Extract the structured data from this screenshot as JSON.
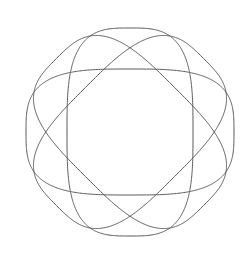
{
  "canvas": {
    "width": 250,
    "height": 269,
    "background_color": "#ffffff",
    "title": "four-petal-spirograph"
  },
  "figure": {
    "name": "four-lobe-rose-curve",
    "stroke_color": "#5a5a5a",
    "stroke_width": 1.0,
    "fill": "none",
    "center_x": 130,
    "center_y": 132,
    "lobe_count": 4,
    "lobe_semi_major": 104,
    "lobe_semi_minor": 63,
    "lobe_squareness": 0.62,
    "rotation_step_degrees": 45,
    "rotations": [
      0,
      45,
      90,
      135
    ],
    "bounds": {
      "left": 22,
      "top": 22,
      "right": 238,
      "bottom": 243
    },
    "intersections": [
      {
        "name": "center-upper-crossing",
        "x": 127,
        "y": 97
      },
      {
        "name": "center-lower-crossing",
        "x": 128,
        "y": 165
      },
      {
        "name": "upper-left-crossing",
        "x": 72,
        "y": 73
      },
      {
        "name": "upper-right-crossing",
        "x": 188,
        "y": 68
      },
      {
        "name": "lower-left-crossing",
        "x": 68,
        "y": 192
      },
      {
        "name": "lower-right-crossing",
        "x": 190,
        "y": 192
      }
    ],
    "center_opening": {
      "name": "central-diamond-void",
      "left": 100,
      "top": 97,
      "right": 160,
      "bottom": 165
    }
  }
}
